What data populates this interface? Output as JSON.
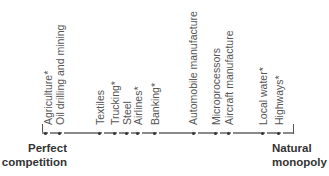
{
  "diagram": {
    "type": "spectrum",
    "left_end": {
      "line1": "Perfect",
      "line2": "competition"
    },
    "right_end": {
      "line1": "Natural",
      "line2": "monopoly"
    },
    "items": [
      {
        "label": "Agriculture*",
        "x": 45
      },
      {
        "label": "Oil drilling and mining",
        "x": 59
      },
      {
        "label": "Textiles",
        "x": 99
      },
      {
        "label": "Trucking*",
        "x": 114
      },
      {
        "label": "Steel",
        "x": 126
      },
      {
        "label": "Airlines*",
        "x": 137
      },
      {
        "label": "Banking*",
        "x": 154
      },
      {
        "label": "Automobile manufacture",
        "x": 193
      },
      {
        "label": "Microprocessors",
        "x": 215
      },
      {
        "label": "Aircraft manufacture",
        "x": 228
      },
      {
        "label": "Local water*",
        "x": 262
      },
      {
        "label": "Highways*",
        "x": 278
      }
    ],
    "colors": {
      "line": "#8a8a8a",
      "dot": "#333333",
      "label": "#555555",
      "end_label": "#333333"
    }
  }
}
